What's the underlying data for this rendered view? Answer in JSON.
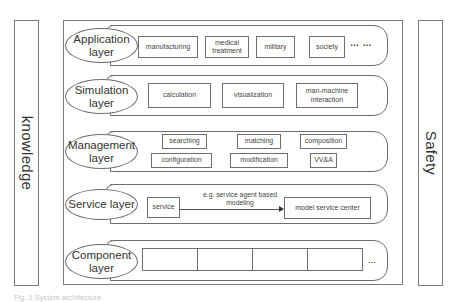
{
  "side_bars": {
    "left": {
      "label": "knowledge"
    },
    "right": {
      "label": "Safety"
    }
  },
  "layers": [
    {
      "name": "Application layer",
      "label_line1": "Application",
      "label_line2": "layer",
      "items": [
        {
          "line1": "manufacturing",
          "line2": ""
        },
        {
          "line1": "medical",
          "line2": "treatment"
        },
        {
          "line1": "military",
          "line2": ""
        },
        {
          "line1": "society",
          "line2": ""
        }
      ],
      "trailing": "… …"
    },
    {
      "name": "Simulation layer",
      "label_line1": "Simulation",
      "label_line2": "layer",
      "items": [
        {
          "line1": "calculation",
          "line2": ""
        },
        {
          "line1": "visualization",
          "line2": ""
        },
        {
          "line1": "man-machine",
          "line2": "interaction"
        }
      ]
    },
    {
      "name": "Management layer",
      "label_line1": "Management",
      "label_line2": "layer",
      "items": [
        {
          "line1": "searching"
        },
        {
          "line1": "matching"
        },
        {
          "line1": "composition"
        },
        {
          "line1": "configuration"
        },
        {
          "line1": "modification"
        },
        {
          "line1": "VV&A"
        }
      ]
    },
    {
      "name": "Service layer",
      "label_line1": "Service layer",
      "label_line2": "",
      "items": [
        {
          "line1": "service"
        },
        {
          "line1": "model service center"
        }
      ],
      "arrow_note_line1": "e.g. service agent based",
      "arrow_note_line2": "modeling"
    },
    {
      "name": "Component layer",
      "label_line1": "Component",
      "label_line2": "layer",
      "cells": 4,
      "trailing": "…"
    }
  ],
  "caption": "Fig. 1 System architecture"
}
